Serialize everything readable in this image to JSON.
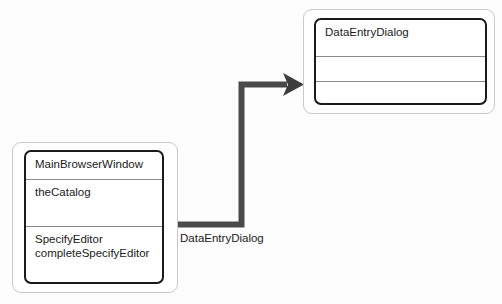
{
  "diagram": {
    "background_color": "#fdfdfd",
    "line_color": "#4a4a4a",
    "box_border_color": "#1a1a1a",
    "frame_border_color": "#c9c9c9",
    "text_color": "#1b1b1b"
  },
  "nodes": [
    {
      "id": "main-browser-window",
      "name": "MainBrowserWindow",
      "compartments": [
        {
          "kind": "name",
          "text": "MainBrowserWindow"
        },
        {
          "kind": "attributes",
          "text": "theCatalog"
        },
        {
          "kind": "operations",
          "text": "SpecifyEditor\ncompleteSpecifyEditor"
        }
      ]
    },
    {
      "id": "data-entry-dialog",
      "name": "DataEntryDialog",
      "compartments": [
        {
          "kind": "name",
          "text": "DataEntryDialog"
        },
        {
          "kind": "attributes",
          "text": ""
        },
        {
          "kind": "operations",
          "text": ""
        }
      ]
    }
  ],
  "connectors": [
    {
      "id": "creates-data-entry-dialog",
      "label": "DataEntryDialog",
      "from": "main-browser-window",
      "to": "data-entry-dialog",
      "arrowhead": "solid-filled"
    }
  ]
}
